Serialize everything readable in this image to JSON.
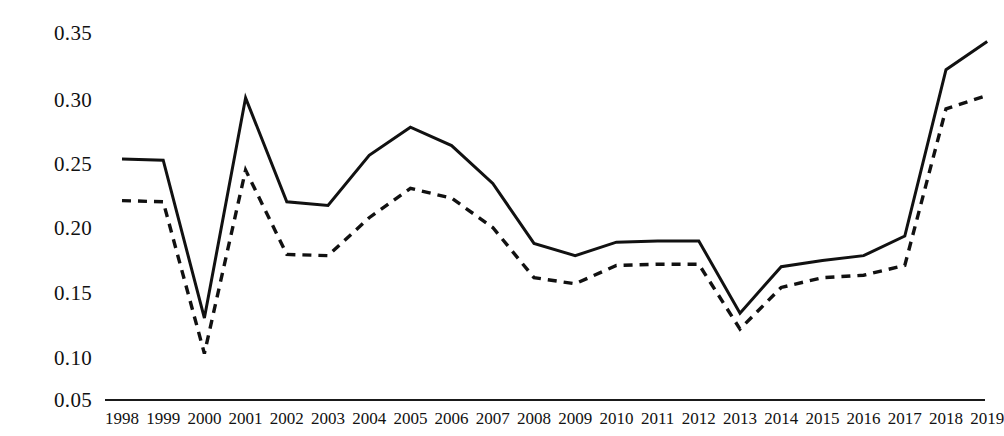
{
  "chart_data": {
    "type": "line",
    "title": "",
    "subtitle": "",
    "xlabel": "",
    "ylabel": "",
    "categories": [
      "1998",
      "1999",
      "2000",
      "2001",
      "2002",
      "2003",
      "2004",
      "2005",
      "2006",
      "2007",
      "2008",
      "2009",
      "2010",
      "2011",
      "2012",
      "2013",
      "2014",
      "2015",
      "2016",
      "2017",
      "2018",
      "2019"
    ],
    "x": [
      1998,
      1999,
      2000,
      2001,
      2002,
      2003,
      2004,
      2005,
      2006,
      2007,
      2008,
      2009,
      2010,
      2011,
      2012,
      2013,
      2014,
      2015,
      2016,
      2017,
      2018,
      2019
    ],
    "series": [
      {
        "name": "solid-line",
        "style": "solid",
        "color": "#111111",
        "values": [
          0.247,
          0.246,
          0.117,
          0.297,
          0.212,
          0.209,
          0.25,
          0.273,
          0.258,
          0.227,
          0.178,
          0.168,
          0.179,
          0.18,
          0.18,
          0.121,
          0.159,
          0.164,
          0.168,
          0.184,
          0.32,
          0.343
        ]
      },
      {
        "name": "dashed-line",
        "style": "dashed",
        "color": "#111111",
        "values": [
          0.213,
          0.212,
          0.088,
          0.238,
          0.169,
          0.168,
          0.199,
          0.223,
          0.215,
          0.191,
          0.15,
          0.145,
          0.16,
          0.161,
          0.161,
          0.108,
          0.142,
          0.15,
          0.152,
          0.16,
          0.288,
          0.299
        ]
      }
    ],
    "ylim": [
      0.05,
      0.365
    ],
    "xlim": [
      1998,
      2019
    ],
    "yticks": [
      0.05,
      0.1,
      0.15,
      0.2,
      0.25,
      0.3,
      0.35
    ],
    "ytick_labels": [
      "0.05",
      "0.10",
      "0.15",
      "0.20",
      "0.25",
      "0.30",
      "0.35"
    ],
    "grid": false,
    "legend": "none",
    "axis_color": "#1a1a1a",
    "background": "#ffffff"
  },
  "layout": {
    "plot_left": 105,
    "plot_right": 985,
    "plot_top": 20,
    "plot_bottom": 400,
    "y_tick_pixels": [
      400,
      358,
      293,
      228,
      164,
      100,
      33
    ],
    "x_label_start": 122,
    "x_label_step": 41.2
  }
}
